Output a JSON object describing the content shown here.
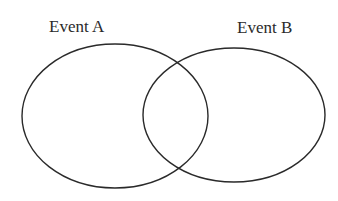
{
  "diagram": {
    "type": "venn",
    "sets": [
      {
        "label": "Event A",
        "cx": 115,
        "cy": 116,
        "rx": 93,
        "ry": 72
      },
      {
        "label": "Event B",
        "cx": 234,
        "cy": 115,
        "rx": 91,
        "ry": 67
      }
    ],
    "stroke_color": "#2a2a2a",
    "background": "#ffffff"
  }
}
